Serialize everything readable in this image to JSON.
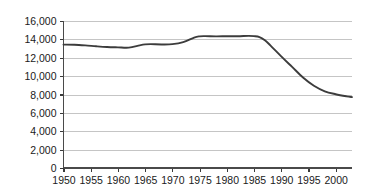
{
  "chart_data": {
    "type": "line",
    "title": "",
    "subtitle": "",
    "xlabel": "",
    "ylabel": "",
    "grid": "horizontal",
    "legend": "none",
    "line_color": "#3c3c3c",
    "gridline_color": "#bfbfbf",
    "axis_color": "#4a4a4a",
    "background_color": "#ffffff",
    "xlim": [
      1950,
      2003
    ],
    "ylim": [
      0,
      16000
    ],
    "y_ticks": [
      0,
      2000,
      4000,
      6000,
      8000,
      10000,
      12000,
      14000,
      16000
    ],
    "y_tick_labels": [
      "0",
      "2,000",
      "4,000",
      "6,000",
      "8,000",
      "10,000",
      "12,000",
      "14,000",
      "16,000"
    ],
    "x_ticks": [
      1950,
      1955,
      1960,
      1965,
      1970,
      1975,
      1980,
      1985,
      1990,
      1995,
      2000
    ],
    "x_tick_labels": [
      "1950",
      "1955",
      "1960",
      "1965",
      "1970",
      "1975",
      "1980",
      "1985",
      "1990",
      "1995",
      "2000"
    ],
    "series": [
      {
        "name": "value",
        "x": [
          1950,
          1952,
          1954,
          1956,
          1958,
          1960,
          1962,
          1964,
          1965,
          1966,
          1968,
          1970,
          1972,
          1974,
          1975,
          1976,
          1978,
          1980,
          1982,
          1984,
          1985,
          1986,
          1987,
          1988,
          1990,
          1992,
          1994,
          1996,
          1998,
          2000,
          2002,
          2003
        ],
        "values": [
          13430,
          13420,
          13350,
          13250,
          13170,
          13130,
          13100,
          13350,
          13450,
          13480,
          13450,
          13480,
          13700,
          14200,
          14330,
          14350,
          14330,
          14340,
          14340,
          14380,
          14350,
          14250,
          13900,
          13350,
          12150,
          11000,
          9850,
          8950,
          8350,
          8030,
          7800,
          7720
        ]
      }
    ]
  }
}
